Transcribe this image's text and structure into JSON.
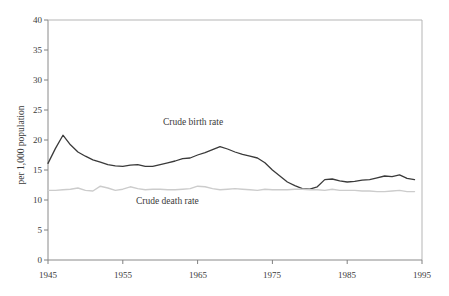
{
  "chart_data": {
    "type": "line",
    "title": "",
    "xlabel": "",
    "ylabel": "per 1,000 population",
    "xlim": [
      1945,
      1995
    ],
    "ylim": [
      0,
      40
    ],
    "grid": false,
    "legend_position": "inline-annotations",
    "x_ticks": [
      "1945",
      "1955",
      "1965",
      "1975",
      "1985",
      "1995"
    ],
    "y_ticks": [
      "0",
      "5",
      "10",
      "15",
      "20",
      "25",
      "30",
      "35",
      "40"
    ],
    "x": [
      1945,
      1946,
      1947,
      1948,
      1949,
      1950,
      1951,
      1952,
      1953,
      1954,
      1955,
      1956,
      1957,
      1958,
      1959,
      1960,
      1961,
      1962,
      1963,
      1964,
      1965,
      1966,
      1967,
      1968,
      1969,
      1970,
      1971,
      1972,
      1973,
      1974,
      1975,
      1976,
      1977,
      1978,
      1979,
      1980,
      1981,
      1982,
      1983,
      1984,
      1985,
      1986,
      1987,
      1988,
      1989,
      1990,
      1991,
      1992,
      1993,
      1994
    ],
    "series": [
      {
        "name": "Crude birth rate",
        "color": "#3a3a3a",
        "values": [
          16.1,
          18.6,
          20.8,
          19.2,
          18.0,
          17.3,
          16.7,
          16.3,
          15.9,
          15.7,
          15.6,
          15.8,
          15.9,
          15.6,
          15.6,
          15.9,
          16.2,
          16.5,
          16.9,
          17.0,
          17.5,
          17.9,
          18.4,
          18.9,
          18.5,
          18.0,
          17.6,
          17.3,
          17.0,
          16.2,
          15.0,
          14.0,
          13.0,
          12.4,
          11.9,
          11.8,
          12.2,
          13.4,
          13.5,
          13.2,
          13.0,
          13.1,
          13.3,
          13.4,
          13.7,
          14.0,
          13.9,
          14.2,
          13.6,
          13.4
        ]
      },
      {
        "name": "Crude death rate",
        "color": "#cccccc",
        "values": [
          11.6,
          11.6,
          11.7,
          11.8,
          12.0,
          11.6,
          11.5,
          12.3,
          12.0,
          11.6,
          11.8,
          12.2,
          11.9,
          11.7,
          11.8,
          11.8,
          11.7,
          11.7,
          11.8,
          11.9,
          12.3,
          12.2,
          11.9,
          11.7,
          11.8,
          11.9,
          11.8,
          11.7,
          11.6,
          11.8,
          11.7,
          11.7,
          11.7,
          11.8,
          11.8,
          11.7,
          11.7,
          11.6,
          11.8,
          11.6,
          11.6,
          11.6,
          11.5,
          11.5,
          11.4,
          11.4,
          11.5,
          11.6,
          11.4,
          11.4
        ]
      }
    ],
    "annotations": [
      {
        "text": "Crude birth rate",
        "x": 1963,
        "y": 22
      },
      {
        "text": "Crude death rate",
        "x": 1960,
        "y": 8.5
      }
    ]
  },
  "axes": {
    "y_title": "per 1,000 population",
    "y_tick_40": "40",
    "y_tick_35": "35",
    "y_tick_30": "30",
    "y_tick_25": "25",
    "y_tick_20": "20",
    "y_tick_15": "15",
    "y_tick_10": "10",
    "y_tick_5": "5",
    "y_tick_0": "0",
    "x_tick_1945": "1945",
    "x_tick_1955": "1955",
    "x_tick_1965": "1965",
    "x_tick_1975": "1975",
    "x_tick_1985": "1985",
    "x_tick_1995": "1995"
  },
  "labels": {
    "birth_series": "Crude birth rate",
    "death_series": "Crude death rate"
  },
  "colors": {
    "birth_line": "#3a3a3a",
    "death_line": "#cccccc",
    "axis": "#808080",
    "text": "#3a3a3a",
    "background": "#ffffff"
  }
}
